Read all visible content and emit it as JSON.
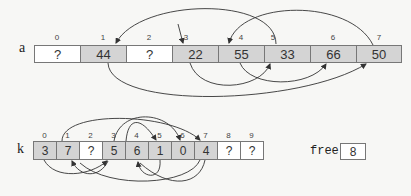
{
  "array_a": {
    "label": "a",
    "cells": [
      {
        "index": "0",
        "value": "?",
        "filled": false
      },
      {
        "index": "1",
        "value": "44",
        "filled": true
      },
      {
        "index": "2",
        "value": "?",
        "filled": false
      },
      {
        "index": "3",
        "value": "22",
        "filled": true
      },
      {
        "index": "4",
        "value": "55",
        "filled": true
      },
      {
        "index": "5",
        "value": "33",
        "filled": true
      },
      {
        "index": "6",
        "value": "66",
        "filled": true
      },
      {
        "index": "7",
        "value": "50",
        "filled": true
      }
    ]
  },
  "array_k": {
    "label": "k",
    "cells": [
      {
        "index": "0",
        "value": "3",
        "filled": true
      },
      {
        "index": "1",
        "value": "7",
        "filled": true
      },
      {
        "index": "2",
        "value": "?",
        "filled": false
      },
      {
        "index": "3",
        "value": "5",
        "filled": true
      },
      {
        "index": "4",
        "value": "6",
        "filled": true
      },
      {
        "index": "5",
        "value": "1",
        "filled": true
      },
      {
        "index": "6",
        "value": "0",
        "filled": true
      },
      {
        "index": "7",
        "value": "4",
        "filled": true
      },
      {
        "index": "8",
        "value": "?",
        "filled": false
      },
      {
        "index": "9",
        "value": "?",
        "filled": false
      }
    ]
  },
  "free": {
    "label": "free",
    "value": "8"
  },
  "colors": {
    "filled_cell": "#d4d4d4",
    "empty_cell": "#ffffff",
    "border": "#777777",
    "arrow": "#333333"
  }
}
